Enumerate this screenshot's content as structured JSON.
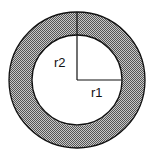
{
  "diagram": {
    "type": "annulus",
    "labels": {
      "inner_radius": "r1",
      "outer_radius": "r2"
    },
    "colors": {
      "ring_fill": "#8a8a8a",
      "stroke": "#111111",
      "background": "#ffffff"
    }
  }
}
